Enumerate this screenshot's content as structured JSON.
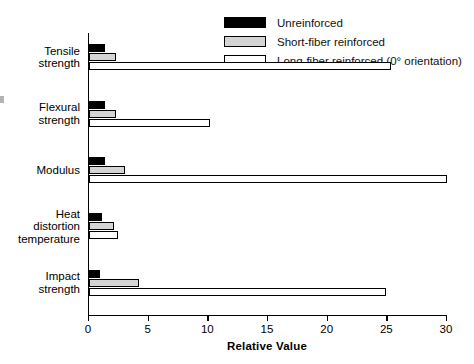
{
  "chart_data": {
    "type": "bar",
    "orientation": "horizontal",
    "title": "",
    "xlabel": "Relative Value",
    "ylabel": "",
    "xlim": [
      0,
      30
    ],
    "xticks": [
      0,
      5,
      10,
      15,
      20,
      25,
      30
    ],
    "grid": false,
    "legend_position": "top-right",
    "categories": [
      "Tensile\nstrength",
      "Flexural\nstrength",
      "Modulus",
      "Heat\ndistortion\ntemperature",
      "Impact\nstrength"
    ],
    "category_lines": [
      [
        "Tensile",
        "strength"
      ],
      [
        "Flexural",
        "strength"
      ],
      [
        "Modulus"
      ],
      [
        "Heat",
        "distortion",
        "temperature"
      ],
      [
        "Impact",
        "strength"
      ]
    ],
    "series": [
      {
        "name": "Unreinforced",
        "color": "#000000",
        "values": [
          1.3,
          1.3,
          1.3,
          1.1,
          0.9
        ]
      },
      {
        "name": "Short-fiber reinforced",
        "color": "#d4d4d4",
        "values": [
          2.3,
          2.3,
          3.0,
          2.1,
          4.2
        ]
      },
      {
        "name": "Long-fiber reinforced (0° orientation)",
        "color": "#ffffff",
        "values": [
          25.3,
          10.1,
          30.0,
          2.4,
          24.9
        ]
      }
    ]
  },
  "legend": {
    "items": [
      {
        "label": "Unreinforced",
        "swatch": "black"
      },
      {
        "label": "Short-fiber reinforced",
        "swatch": "gray"
      },
      {
        "label": "Long-fiber reinforced (0° orientation)",
        "swatch": "white"
      }
    ]
  },
  "axis": {
    "x_label": "Relative Value",
    "x_tick_labels": [
      "0",
      "5",
      "10",
      "15",
      "20",
      "25",
      "30"
    ]
  }
}
